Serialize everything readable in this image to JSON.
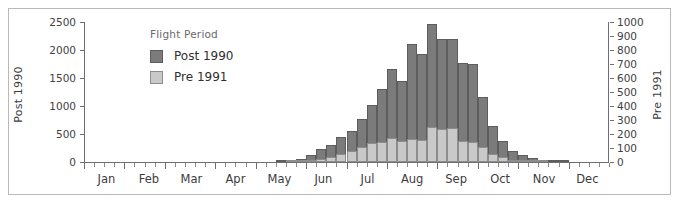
{
  "chart_data": {
    "type": "bar",
    "title": "",
    "subtitle": "",
    "xlabel": "",
    "ylabel": "Post 1990",
    "y2label": "Pre 1991",
    "ylim": [
      0,
      2500
    ],
    "y2lim": [
      0,
      1000
    ],
    "grid": false,
    "stacked_overlay": true,
    "legend": {
      "title": "Flight Period",
      "position": "inside-top-left",
      "entries": [
        {
          "name": "Post 1990",
          "color": "#7b7b7c"
        },
        {
          "name": "Pre 1991",
          "color": "#c9c9ca"
        }
      ]
    },
    "y_left_ticks": [
      0,
      500,
      1000,
      1500,
      2000,
      2500
    ],
    "y_right_ticks": [
      0,
      100,
      200,
      300,
      400,
      500,
      600,
      700,
      800,
      900,
      1000
    ],
    "month_labels": [
      "Jan",
      "Feb",
      "Mar",
      "Apr",
      "May",
      "Jun",
      "Jul",
      "Aug",
      "Sep",
      "Oct",
      "Nov",
      "Dec"
    ],
    "x_bin": "week",
    "x_bin_count": 52,
    "series": [
      {
        "name": "Post 1990",
        "axis": "left",
        "color": "#7b7b7c",
        "values": [
          0,
          0,
          0,
          0,
          0,
          0,
          0,
          0,
          0,
          0,
          0,
          0,
          0,
          0,
          0,
          0,
          0,
          0,
          5,
          15,
          30,
          60,
          130,
          230,
          310,
          440,
          560,
          760,
          1010,
          1310,
          1660,
          1440,
          2110,
          1920,
          2460,
          2190,
          2200,
          1760,
          1750,
          1160,
          650,
          370,
          190,
          120,
          70,
          40,
          20,
          10,
          5,
          3,
          0,
          0
        ]
      },
      {
        "name": "Pre 1991",
        "axis": "right",
        "color": "#c9c9ca",
        "values": [
          0,
          0,
          0,
          0,
          0,
          0,
          0,
          0,
          0,
          0,
          0,
          0,
          0,
          0,
          0,
          0,
          0,
          0,
          0,
          2,
          4,
          8,
          15,
          25,
          35,
          55,
          80,
          110,
          135,
          145,
          170,
          150,
          165,
          160,
          250,
          235,
          240,
          150,
          145,
          110,
          60,
          35,
          15,
          10,
          5,
          3,
          2,
          0,
          0,
          0,
          0,
          0
        ]
      }
    ]
  }
}
